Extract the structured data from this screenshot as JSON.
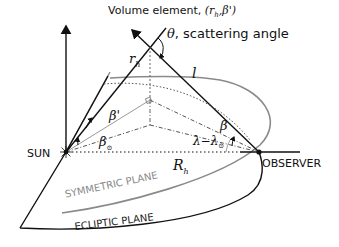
{
  "diagram": {
    "title_label": "Volume element,",
    "title_coords": "(r",
    "title_coords_sub": "h",
    "title_coords_tail": ",β')",
    "theta_symbol": "θ",
    "theta_label": ", scattering angle",
    "r_h": "r",
    "r_h_sub": "h",
    "l": "l",
    "beta_prime": "β'",
    "beta_sun": "β",
    "beta_sun_sub": "⊙",
    "beta": "β",
    "lambda_diff": "λ−λ",
    "lambda_sub": "⊙",
    "R_h": "R",
    "R_h_sub": "h",
    "sun": "SUN",
    "observer": "OBSERVER",
    "symmetric_plane": "SYMMETRIC PLANE",
    "ecliptic_plane": "ECLIPTIC PLANE"
  },
  "colors": {
    "line": "#111111",
    "grey_plane": "#8a8a8a",
    "light_line": "#bbbbbb"
  }
}
